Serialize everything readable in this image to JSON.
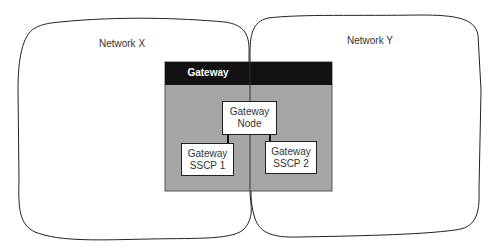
{
  "diagram": {
    "networks": [
      {
        "id": "network-x",
        "label": "Network X"
      },
      {
        "id": "network-y",
        "label": "Network Y"
      }
    ],
    "gateway": {
      "title": "Gateway",
      "header_color": "#111111",
      "body_color": "#a6a6a6",
      "node": {
        "line1": "Gateway",
        "line2": "Node"
      },
      "sscp1": {
        "line1": "Gateway",
        "line2": "SSCP 1"
      },
      "sscp2": {
        "line1": "Gateway",
        "line2": "SSCP 2"
      }
    }
  }
}
